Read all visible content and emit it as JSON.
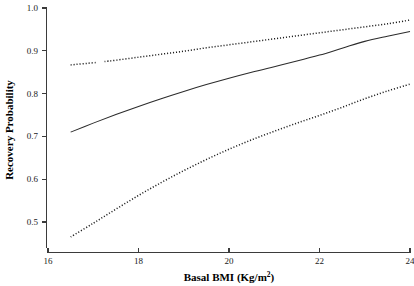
{
  "figure": {
    "background_color": "#ffffff",
    "width": 414,
    "height": 286
  },
  "axes": {
    "x_title": "Basal BMI (Kg/m",
    "x_title_sup": "2",
    "x_title_close": ")",
    "y_title": "Recovery Probability",
    "x_ticks": [
      "16",
      "18",
      "20",
      "22",
      "24"
    ],
    "y_ticks": [
      "0.5",
      "0.6",
      "0.7",
      "0.8",
      "0.9",
      "1.0"
    ]
  },
  "chart_data": {
    "type": "line",
    "title": "",
    "xlabel": "Basal BMI (Kg/m2)",
    "ylabel": "Recovery Probability",
    "xlim": [
      16,
      24
    ],
    "ylim": [
      0.44,
      1.0
    ],
    "grid": false,
    "legend": "none",
    "x_tick_values": [
      16,
      18,
      20,
      22,
      24
    ],
    "y_tick_values": [
      0.5,
      0.6,
      0.7,
      0.8,
      0.9,
      1.0
    ],
    "x": [
      16.5,
      17.0,
      17.5,
      18.0,
      18.5,
      19.0,
      19.5,
      20.0,
      20.5,
      21.0,
      21.5,
      22.0,
      22.5,
      23.0,
      23.5,
      24.0
    ],
    "series": [
      {
        "name": "Upper 95% confidence limit",
        "style": "dotted",
        "color": "#1e1e1e",
        "values": [
          0.867,
          0.872,
          0.878,
          0.885,
          0.892,
          0.899,
          0.907,
          0.914,
          0.921,
          0.928,
          0.935,
          0.942,
          0.949,
          0.956,
          0.963,
          0.972
        ],
        "gap_x_range": [
          17.08,
          17.25
        ]
      },
      {
        "name": "Predicted recovery probability",
        "style": "solid",
        "color": "#2b2b2b",
        "values": [
          0.71,
          0.731,
          0.751,
          0.77,
          0.788,
          0.805,
          0.821,
          0.836,
          0.85,
          0.863,
          0.876,
          0.89,
          0.906,
          0.922,
          0.934,
          0.945
        ]
      },
      {
        "name": "Lower 95% confidence limit",
        "style": "dotted",
        "color": "#1e1e1e",
        "values": [
          0.465,
          0.497,
          0.53,
          0.562,
          0.592,
          0.62,
          0.646,
          0.67,
          0.692,
          0.712,
          0.731,
          0.749,
          0.768,
          0.788,
          0.806,
          0.822
        ]
      }
    ]
  }
}
